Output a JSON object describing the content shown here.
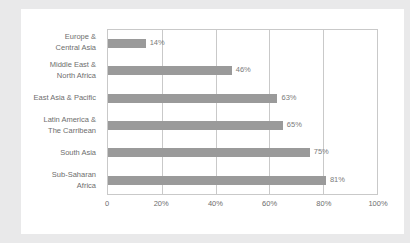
{
  "chart_data": {
    "type": "bar",
    "orientation": "horizontal",
    "title": "",
    "xlabel": "",
    "ylabel": "",
    "xlim": [
      0,
      100
    ],
    "grid": true,
    "legend": false,
    "categories": [
      "Europe &\nCentral Asia",
      "Middle East &\nNorth Africa",
      "East Asia & Pacific",
      "Latin America &\nThe Carribean",
      "South Asia",
      "Sub-Saharan\nAfrica"
    ],
    "values": [
      14,
      46,
      63,
      65,
      75,
      81
    ],
    "data_labels": [
      "14%",
      "46%",
      "63%",
      "65%",
      "75%",
      "81%"
    ],
    "xticks": [
      0,
      20,
      40,
      60,
      80,
      100
    ],
    "xtick_labels": [
      "0",
      "20%",
      "40%",
      "60%",
      "80%",
      "100%"
    ],
    "bar_color": "#9a9a9a",
    "grid_color": "#c9c9c9",
    "text_color": "#6e6e6e",
    "background_color": "#ffffff"
  }
}
